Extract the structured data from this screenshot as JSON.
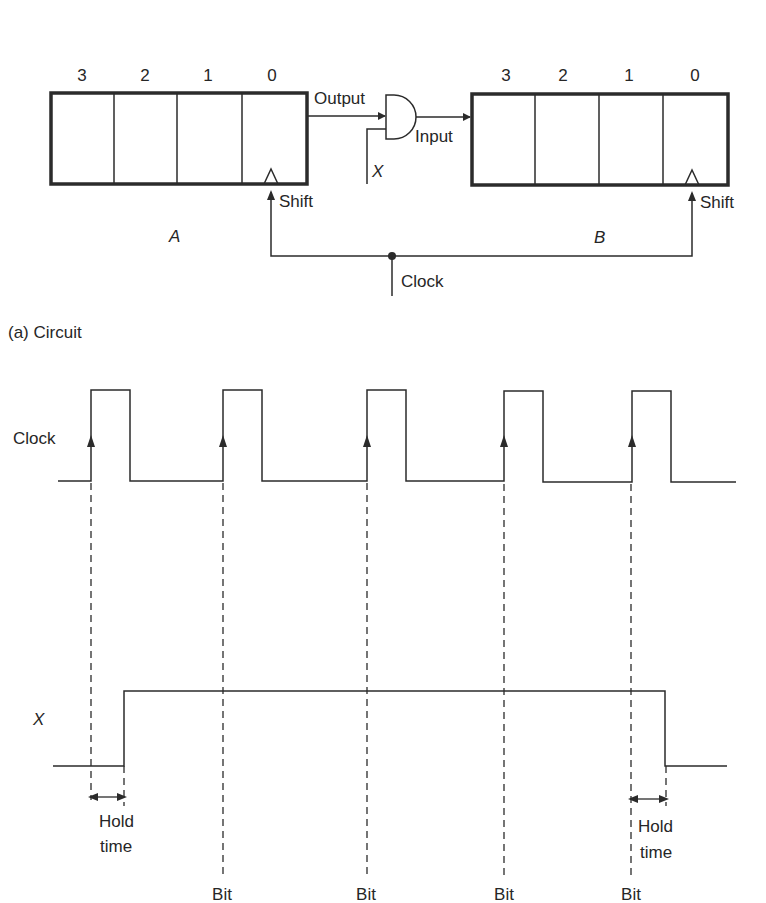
{
  "figure": {
    "circuit": {
      "caption": "(a)  Circuit",
      "register_a": {
        "name": "A",
        "bit_labels": [
          "3",
          "2",
          "1",
          "0"
        ],
        "shift_label": "Shift"
      },
      "register_b": {
        "name": "B",
        "bit_labels": [
          "3",
          "2",
          "1",
          "0"
        ],
        "shift_label": "Shift"
      },
      "and_gate": {
        "input_label_a": "Output",
        "input_label_x": "X",
        "output_label": "Input"
      },
      "clock_label": "Clock"
    },
    "timing": {
      "clock_label": "Clock",
      "x_label": "X",
      "clock_pulses": 5,
      "hold_time_label_line1": "Hold",
      "hold_time_label_line2": "time",
      "bit_labels": [
        "Bit",
        "Bit",
        "Bit",
        "Bit"
      ]
    },
    "colors": {
      "line": "#2b2b2b",
      "text": "#262626",
      "background": "#ffffff"
    }
  }
}
